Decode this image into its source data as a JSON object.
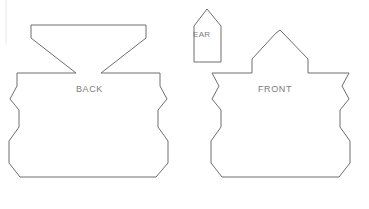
{
  "document": {
    "kind": "sewing-pattern-template",
    "title": "",
    "background_color": "#ffffff",
    "outline_color": "#6e6e6e",
    "label_color": "#7b7b7b",
    "width": 369,
    "height": 209
  },
  "pieces": [
    {
      "id": "back",
      "label": "BACK",
      "label_x": 76,
      "label_y": 84,
      "description": "Large body piece with flared trapezoid top and deep V notch",
      "points": "100,25 31,25 31,38 76,73 17,73 17,86 10,99 19,110 19,127 9,141 9,163 20,177 156,177 168,163 168,141 158,127 158,110 167,99 160,86 160,73 101,73 146,38 146,25"
    },
    {
      "id": "ear",
      "label": "EAR",
      "label_x": 193,
      "label_y": 30,
      "description": "Small pentagon house shape with pointed peak",
      "points": "207,9 194,26 194,62 221,62 221,26"
    },
    {
      "id": "front",
      "label": "FRONT",
      "label_x": 258,
      "label_y": 84,
      "description": "Large body piece with pointed peaked head",
      "points": "276,33 280,30 283,33 308,59 308,73 349,73 342,86 349,99 340,110 340,127 350,141 350,163 339,177 222,177 211,163 211,141 221,127 221,110 212,99 219,86 212,73 252,73 252,59"
    }
  ],
  "decorations": [
    {
      "id": "left-margin-rule",
      "type": "vertical-line",
      "x": 6,
      "y1": 0,
      "y2": 44,
      "color": "#e8e8e8"
    }
  ]
}
